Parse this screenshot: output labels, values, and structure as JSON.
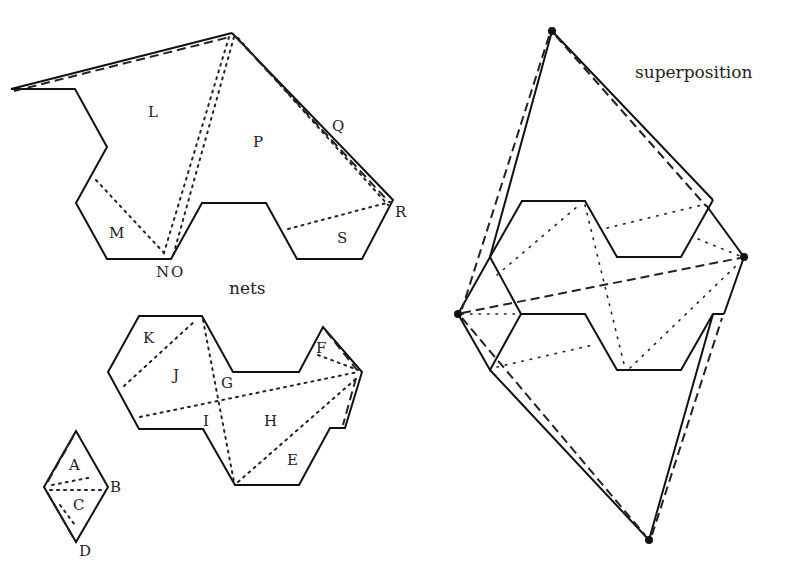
{
  "captions": {
    "nets": "nets",
    "superposition": "superposition"
  },
  "labels": {
    "L": "L",
    "M": "M",
    "N": "N",
    "O": "O",
    "P": "P",
    "Q": "Q",
    "R": "R",
    "S": "S",
    "K": "K",
    "J": "J",
    "G": "G",
    "F": "F",
    "I": "I",
    "H": "H",
    "E": "E",
    "A": "A",
    "B": "B",
    "C": "C",
    "D": "D"
  },
  "colors": {
    "stroke": "#111111",
    "background": "#ffffff"
  },
  "figures": {
    "net_top": {
      "pieces": [
        "L",
        "M",
        "N",
        "O",
        "P",
        "Q",
        "R",
        "S"
      ]
    },
    "net_middle": {
      "pieces": [
        "K",
        "J",
        "G",
        "F",
        "I",
        "H",
        "E"
      ]
    },
    "net_small": {
      "pieces": [
        "A",
        "B",
        "C",
        "D"
      ]
    },
    "superposition": {
      "marked_vertices": 4
    }
  }
}
